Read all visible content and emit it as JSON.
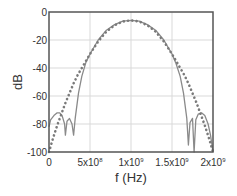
{
  "chart_data": {
    "type": "line",
    "title": "",
    "xlabel": "f (Hz)",
    "ylabel": "dB",
    "xlim": [
      0,
      2000000000
    ],
    "ylim": [
      -100,
      0
    ],
    "grid": true,
    "legend": null,
    "x_ticks": [
      {
        "value": 0,
        "label": "0",
        "sup": ""
      },
      {
        "value": 500000000,
        "label": "5x10",
        "sup": "8"
      },
      {
        "value": 1000000000,
        "label": "1x10",
        "sup": "9"
      },
      {
        "value": 1500000000,
        "label": "1.5x10",
        "sup": "9"
      },
      {
        "value": 2000000000,
        "label": "2x10",
        "sup": "9"
      }
    ],
    "y_ticks": [
      {
        "value": 0,
        "label": "0"
      },
      {
        "value": -20,
        "label": "-20"
      },
      {
        "value": -40,
        "label": "-40"
      },
      {
        "value": -60,
        "label": "-60"
      },
      {
        "value": -80,
        "label": "-80"
      },
      {
        "value": -100,
        "label": "-100"
      }
    ],
    "series": [
      {
        "name": "solid",
        "style": "solid",
        "color": "#8a8a8a",
        "x": [
          0,
          20000000.0,
          60000000.0,
          100000000.0,
          130000000.0,
          160000000.0,
          190000000.0,
          200000000.0,
          220000000.0,
          250000000.0,
          280000000.0,
          300000000.0,
          320000000.0,
          360000000.0,
          400000000.0,
          450000000.0,
          500000000.0,
          600000000.0,
          700000000.0,
          800000000.0,
          900000000.0,
          1000000000.0,
          1100000000.0,
          1200000000.0,
          1300000000.0,
          1400000000.0,
          1500000000.0,
          1550000000.0,
          1600000000.0,
          1640000000.0,
          1680000000.0,
          1700000000.0,
          1720000000.0,
          1750000000.0,
          1770000000.0,
          1790000000.0,
          1820000000.0,
          1860000000.0,
          1900000000.0,
          1940000000.0,
          1970000000.0,
          2000000000.0
        ],
        "y": [
          -82,
          -77,
          -74,
          -72,
          -72,
          -74,
          -80,
          -88,
          -78,
          -76,
          -80,
          -88,
          -76,
          -58,
          -46,
          -36,
          -30,
          -20,
          -13,
          -9,
          -6.5,
          -6,
          -6.5,
          -9,
          -13,
          -20,
          -30,
          -37,
          -46,
          -58,
          -76,
          -95,
          -79,
          -76,
          -100,
          -77,
          -73,
          -72,
          -74,
          -80,
          -88,
          -100
        ]
      },
      {
        "name": "dotted",
        "style": "dotted",
        "color": "#7a7a7a",
        "x": [
          0,
          50000000.0,
          100000000.0,
          150000000.0,
          200000000.0,
          250000000.0,
          300000000.0,
          350000000.0,
          400000000.0,
          500000000.0,
          600000000.0,
          700000000.0,
          800000000.0,
          900000000.0,
          1000000000.0,
          1100000000.0,
          1200000000.0,
          1300000000.0,
          1400000000.0,
          1500000000.0,
          1600000000.0,
          1650000000.0,
          1700000000.0,
          1750000000.0,
          1800000000.0,
          1850000000.0,
          1900000000.0,
          1950000000.0,
          2000000000.0
        ],
        "y": [
          -100,
          -90,
          -81,
          -73,
          -65,
          -58,
          -51,
          -45,
          -40,
          -30,
          -21,
          -14,
          -9.5,
          -6.8,
          -6,
          -6.8,
          -9.5,
          -14,
          -21,
          -30,
          -40,
          -45,
          -51,
          -58,
          -65,
          -73,
          -81,
          -90,
          -100
        ]
      }
    ]
  },
  "plot": {
    "left": 49,
    "right": 213,
    "top": 12,
    "bottom": 152,
    "frame_color": "#555555",
    "grid_color": "#d9d9d9"
  }
}
